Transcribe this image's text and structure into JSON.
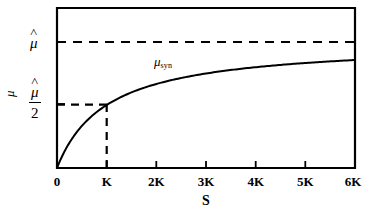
{
  "chart_data": {
    "type": "line",
    "title": "",
    "subtitle": "",
    "xlabel": "S",
    "ylabel": "μ",
    "x_tick_labels": [
      "0",
      "K",
      "2K",
      "3K",
      "4K",
      "5K",
      "6K"
    ],
    "x_tick_values": [
      0,
      1,
      2,
      3,
      4,
      5,
      6
    ],
    "xlim": [
      0,
      6
    ],
    "y_tick_labels": [
      "μ̂",
      "μ̂/2"
    ],
    "y_tick_values": [
      1.0,
      0.5
    ],
    "ylim": [
      0,
      1.17
    ],
    "grid": false,
    "legend": "inline-annotation",
    "series": [
      {
        "name": "μ_syn",
        "label_text": "μ",
        "label_subscript": "syn",
        "equation": "mu_syn = mu_hat * S / (K + S)",
        "x": [
          0,
          0.1,
          0.2,
          0.3,
          0.4,
          0.5,
          0.75,
          1,
          1.5,
          2,
          2.5,
          3,
          3.5,
          4,
          4.5,
          5,
          5.5,
          6
        ],
        "y": [
          0,
          0.0909,
          0.1667,
          0.2308,
          0.2857,
          0.3333,
          0.4286,
          0.5,
          0.6,
          0.6667,
          0.7143,
          0.75,
          0.7778,
          0.8,
          0.8182,
          0.8333,
          0.8462,
          0.8571
        ]
      }
    ],
    "annotations": [
      {
        "name": "asymptote",
        "type": "horizontal-dashed-line",
        "y": 1.0,
        "x_start": 0,
        "x_end": 6,
        "label": "μ̂"
      },
      {
        "name": "half-saturation-horizontal",
        "type": "horizontal-dashed-line",
        "y": 0.5,
        "x_start": 0,
        "x_end": 1,
        "label": "μ̂/2"
      },
      {
        "name": "half-saturation-vertical",
        "type": "vertical-dashed-line",
        "x": 1,
        "y_start": 0,
        "y_end": 0.5,
        "label": "K"
      }
    ],
    "colors": {
      "curve": "#000000",
      "axis": "#000000",
      "dashed": "#000000",
      "background": "#ffffff"
    }
  },
  "axes": {
    "y_title": "μ",
    "x_title": "S",
    "y_ticks": [
      {
        "mu": "μ",
        "caret": "˄",
        "denominator": null
      },
      {
        "mu": "μ",
        "caret": "˄",
        "denominator": "2"
      }
    ],
    "x_ticks": [
      {
        "label": "0"
      },
      {
        "label": "K"
      },
      {
        "label": "2K"
      },
      {
        "label": "3K"
      },
      {
        "label": "4K"
      },
      {
        "label": "5K"
      },
      {
        "label": "6K"
      }
    ]
  },
  "curve_annotation": {
    "base": "μ",
    "subscript": "syn"
  }
}
